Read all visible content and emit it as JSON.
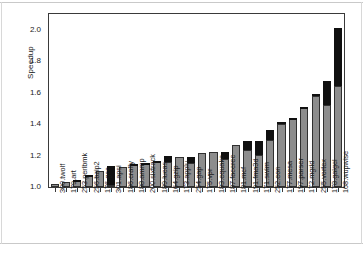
{
  "chart_data": {
    "type": "bar",
    "title": "",
    "subtitle": "",
    "xlabel": "",
    "ylabel": "Speedup",
    "ylim": [
      1.0,
      2.1
    ],
    "yticks": [
      "1.0",
      "1.2",
      "1.4",
      "1.6",
      "1.8",
      "2.0"
    ],
    "ytick_values": [
      1.0,
      1.2,
      1.4,
      1.6,
      1.8,
      2.0
    ],
    "grid": false,
    "legend": "none",
    "stacked": true,
    "baseline": 1.0,
    "categories": [
      "300.twolf",
      "179.art",
      "253.perlbmk",
      "256.bzip2",
      "176.gcc",
      "301.apsi",
      "186.crafty",
      "188.ammp",
      "200.sixtrack",
      "189.lucas",
      "164.gzip",
      "173.applu",
      "254.gap",
      "175.vpr",
      "183.equake",
      "187.facerec",
      "181.mcf",
      "191.fma3d",
      "171.swim",
      "252.eon",
      "177.mesa",
      "197.parser",
      "172.mgrid",
      "255.vortex",
      "178.galgel",
      "168.wupwise"
    ],
    "series": [
      {
        "name": "gray-segment-top",
        "values": [
          1.02,
          1.03,
          1.04,
          1.07,
          1.1,
          1.01,
          1.13,
          1.14,
          1.145,
          1.16,
          1.16,
          1.19,
          1.15,
          1.215,
          1.22,
          1.18,
          1.27,
          1.235,
          1.205,
          1.3,
          1.4,
          1.435,
          1.505,
          1.58,
          1.52,
          1.645
        ]
      },
      {
        "name": "black-segment-top",
        "values": [
          1.02,
          1.03,
          1.045,
          1.075,
          1.1,
          1.135,
          1.13,
          1.145,
          1.15,
          1.165,
          1.195,
          1.19,
          1.19,
          1.215,
          1.22,
          1.225,
          1.27,
          1.29,
          1.29,
          1.36,
          1.415,
          1.44,
          1.51,
          1.59,
          1.675,
          2.01
        ]
      }
    ],
    "colors": {
      "gray_segment": "#8d8d8d",
      "black_segment": "#101010",
      "axis": "#3a3a3a",
      "text": "#1a1a1a",
      "background": "#ffffff"
    }
  }
}
